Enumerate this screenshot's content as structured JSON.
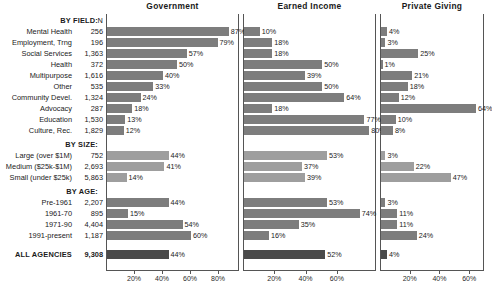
{
  "chart_data": {
    "type": "bar",
    "title": "",
    "orientation": "horizontal",
    "grid": false,
    "legend_position": "none",
    "panels": [
      {
        "name": "Government",
        "xlabel": "",
        "xlim": [
          0,
          95
        ],
        "ticks": [
          20,
          40,
          60,
          80
        ],
        "ticklabels": [
          "20%",
          "40%",
          "60%",
          "80%"
        ]
      },
      {
        "name": "Earned Income",
        "xlabel": "",
        "xlim": [
          0,
          85
        ],
        "ticks": [
          20,
          40,
          60
        ],
        "ticklabels": [
          "20%",
          "40%",
          "60%"
        ]
      },
      {
        "name": "Private Giving",
        "xlabel": "",
        "xlim": [
          0,
          70
        ],
        "ticks": [
          20,
          40,
          60
        ],
        "ticklabels": [
          "20%",
          "40%",
          "60%"
        ]
      }
    ],
    "column_header_n": "N",
    "groups": [
      {
        "header": "BY FIELD:",
        "style": "field",
        "rows": [
          {
            "label": "Mental Health",
            "n": "256",
            "government": 87,
            "earned_income": 10,
            "private_giving": 4
          },
          {
            "label": "Employment, Trng",
            "n": "196",
            "government": 79,
            "earned_income": 18,
            "private_giving": 3
          },
          {
            "label": "Social Services",
            "n": "1,363",
            "government": 57,
            "earned_income": 18,
            "private_giving": 25
          },
          {
            "label": "Health",
            "n": "372",
            "government": 50,
            "earned_income": 50,
            "private_giving": 1
          },
          {
            "label": "Multipurpose",
            "n": "1,616",
            "government": 40,
            "earned_income": 39,
            "private_giving": 21
          },
          {
            "label": "Other",
            "n": "535",
            "government": 33,
            "earned_income": 50,
            "private_giving": 18
          },
          {
            "label": "Community Devel.",
            "n": "1,324",
            "government": 24,
            "earned_income": 64,
            "private_giving": 12
          },
          {
            "label": "Advocacy",
            "n": "287",
            "government": 18,
            "earned_income": 18,
            "private_giving": 64
          },
          {
            "label": "Education",
            "n": "1,530",
            "government": 13,
            "earned_income": 77,
            "private_giving": 10
          },
          {
            "label": "Culture, Rec.",
            "n": "1,829",
            "government": 12,
            "earned_income": 80,
            "private_giving": 8
          }
        ]
      },
      {
        "header": "BY SIZE:",
        "style": "size",
        "rows": [
          {
            "label": "Large (over $1M)",
            "n": "752",
            "government": 44,
            "earned_income": 53,
            "private_giving": 3
          },
          {
            "label": "Medium ($25k-$1M)",
            "n": "2,693",
            "government": 41,
            "earned_income": 37,
            "private_giving": 22
          },
          {
            "label": "Small (under  $25k)",
            "n": "5,863",
            "government": 14,
            "earned_income": 39,
            "private_giving": 47
          }
        ]
      },
      {
        "header": "BY AGE:",
        "style": "age",
        "rows": [
          {
            "label": "Pre-1961",
            "n": "2,207",
            "government": 44,
            "earned_income": 53,
            "private_giving": 3
          },
          {
            "label": "1961-70",
            "n": "895",
            "government": 15,
            "earned_income": 74,
            "private_giving": 11
          },
          {
            "label": "1971-90",
            "n": "4,404",
            "government": 54,
            "earned_income": 35,
            "private_giving": 11
          },
          {
            "label": "1991-present",
            "n": "1,187",
            "government": 60,
            "earned_income": 16,
            "private_giving": 24
          }
        ]
      },
      {
        "header": "",
        "style": "all",
        "rows": [
          {
            "label": "ALL AGENCIES",
            "n": "9,308",
            "government": 44,
            "earned_income": 52,
            "private_giving": 4
          }
        ]
      }
    ],
    "value_labels_suffix": "%",
    "colors": {
      "bar_field": "#7d7d7d",
      "bar_size": "#9e9e9e",
      "bar_age": "#7d7d7d",
      "bar_all": "#4a4a4a",
      "axis": "#555555",
      "text": "#1a1a1a",
      "background": "#ffffff"
    }
  }
}
